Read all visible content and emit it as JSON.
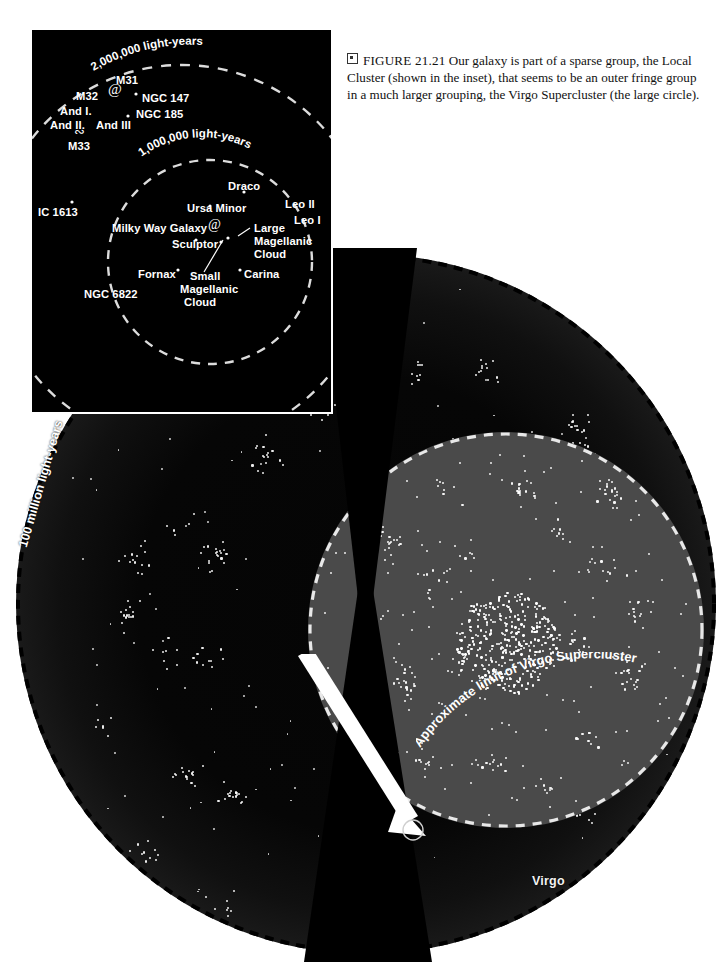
{
  "caption": {
    "marker_icon": "figure-square-icon",
    "figure_number": "FIGURE 21.21",
    "text": "Our galaxy is part of a sparse group, the Local Cluster (shown in the inset), that seems to be an outer fringe group in a much larger grouping, the Virgo Supercluster (the large circle)."
  },
  "inset": {
    "name": "local-cluster-inset",
    "rings": [
      {
        "label": "2,000,000 light-years"
      },
      {
        "label": "1,000,000 light-years"
      }
    ],
    "objects": [
      {
        "label": "M31",
        "x": 84,
        "y": 44
      },
      {
        "label": "M32",
        "x": 44,
        "y": 60
      },
      {
        "label": "And I.",
        "x": 28,
        "y": 75
      },
      {
        "label": "And II.",
        "x": 18,
        "y": 89
      },
      {
        "label": "And III",
        "x": 64,
        "y": 89
      },
      {
        "label": "M33",
        "x": 36,
        "y": 110
      },
      {
        "label": "NGC 147",
        "x": 110,
        "y": 62
      },
      {
        "label": "NGC 185",
        "x": 104,
        "y": 78
      },
      {
        "label": "IC 1613",
        "x": 6,
        "y": 176
      },
      {
        "label": "Draco",
        "x": 196,
        "y": 150
      },
      {
        "label": "Ursa Minor",
        "x": 155,
        "y": 172
      },
      {
        "label": "Milky Way Galaxy",
        "x": 80,
        "y": 192
      },
      {
        "label": "Sculptor",
        "x": 140,
        "y": 208
      },
      {
        "label": "Leo II",
        "x": 253,
        "y": 168
      },
      {
        "label": "Leo I",
        "x": 262,
        "y": 184
      },
      {
        "label": "Large",
        "x": 222,
        "y": 192
      },
      {
        "label": "Magellanic",
        "x": 222,
        "y": 205
      },
      {
        "label": "Cloud",
        "x": 222,
        "y": 218
      },
      {
        "label": "Fornax",
        "x": 106,
        "y": 238
      },
      {
        "label": "Carina",
        "x": 212,
        "y": 238
      },
      {
        "label": "Small",
        "x": 158,
        "y": 240
      },
      {
        "label": "Magellanic",
        "x": 148,
        "y": 253
      },
      {
        "label": "Cloud",
        "x": 152,
        "y": 266
      },
      {
        "label": "NGC 6822",
        "x": 52,
        "y": 258
      }
    ]
  },
  "main": {
    "name": "virgo-supercluster-panel",
    "scale_label": "100 million light-years",
    "supercluster_limit_label": "Approximate limit of Virgo Supercluster",
    "virgo_label": "Virgo",
    "arrow": {
      "name": "inset-pointer-arrow"
    }
  },
  "colors": {
    "page_background": "#ffffff",
    "deep_space": "#050505",
    "outer_halo": "#2e2e2e",
    "virgo_disc": "#4a4a4a",
    "galaxy_dot": "#ffffff",
    "label_text": "#ffffff",
    "caption_text": "#111111"
  }
}
